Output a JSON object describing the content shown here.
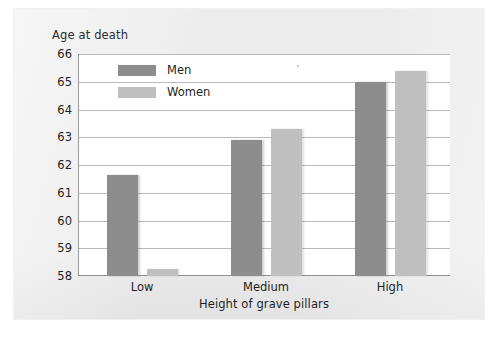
{
  "chart_data": {
    "type": "bar",
    "title": "",
    "subtitle": "",
    "xlabel": "Height of grave pillars",
    "ylabel": "Age at death",
    "categories": [
      "Low",
      "Medium",
      "High"
    ],
    "series": [
      {
        "name": "Men",
        "color": "#8d8d8d",
        "values": [
          61.65,
          62.9,
          65.0
        ]
      },
      {
        "name": "Women",
        "color": "#bfbfbf",
        "values": [
          58.25,
          63.3,
          65.4
        ]
      }
    ],
    "ylim": [
      58,
      66
    ],
    "y_ticks": [
      58,
      59,
      60,
      61,
      62,
      63,
      64,
      65,
      66
    ],
    "y_tick_labels": [
      "58",
      "59",
      "60",
      "61",
      "62",
      "63",
      "64",
      "65",
      "66"
    ],
    "grid": true,
    "legend_position": "top-left-inside"
  },
  "legend": {
    "entries": [
      {
        "label": "Men",
        "color": "#8d8d8d"
      },
      {
        "label": "Women",
        "color": "#bfbfbf"
      }
    ]
  },
  "axes": {
    "y_title": "Age at death",
    "x_title": "Height of grave pillars"
  }
}
